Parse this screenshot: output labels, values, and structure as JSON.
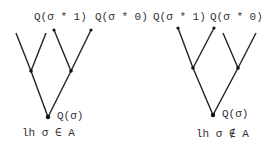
{
  "left_tree": {
    "leaf_label_1": "Q(σ * 1)",
    "leaf_label_0": "Q(σ * 0)",
    "root_label": "Q(σ)",
    "caption": "lh σ ∈ A"
  },
  "right_tree": {
    "leaf_label_1": "Q(σ * 1)",
    "leaf_label_0": "Q(σ * 0)",
    "root_label": "Q(σ)",
    "caption": "lh σ ∉ A"
  }
}
